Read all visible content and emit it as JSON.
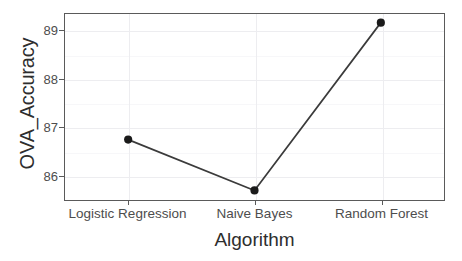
{
  "chart_data": {
    "type": "line",
    "title": "",
    "xlabel": "Algorithm",
    "ylabel": "OVA_Accuracy",
    "categories": [
      "Logistic Regression",
      "Naive Bayes",
      "Random Forest"
    ],
    "values": [
      86.74,
      85.68,
      89.18
    ],
    "series": [
      {
        "name": "OVA_Accuracy",
        "values": [
          86.74,
          85.68,
          89.18
        ]
      }
    ],
    "x_tick_labels": [
      "Logistic Regression",
      "Naive Bayes",
      "Random Forest"
    ],
    "y_tick_labels": [
      "86",
      "87",
      "88",
      "89"
    ],
    "y_tick_values": [
      86,
      87,
      88,
      89
    ],
    "y_minor_tick_values": [
      85.5,
      86.5,
      87.5,
      88.5,
      89.5
    ],
    "ylim": [
      85.48,
      89.36
    ],
    "xlim": [
      0.5,
      3.5
    ],
    "grid": true,
    "legend": "none",
    "markers": "filled-circle",
    "line_color": "#3b3b3b",
    "marker_color": "#1a1a1a",
    "panel_background": "#ffffff",
    "grid_color": "#ededf0",
    "axis_color": "#5a5a5a",
    "text_color": "#4d4d4d"
  },
  "axes": {
    "x_title": "Algorithm",
    "y_title": "OVA_Accuracy"
  }
}
